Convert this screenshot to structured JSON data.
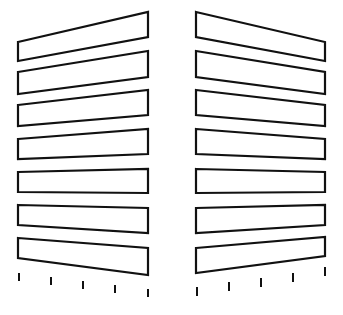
{
  "figure": {
    "stroke_color": "#111111",
    "fill_color": "#ffffff",
    "background": "#ffffff",
    "stroke_width": 2.2
  },
  "left_panel": {
    "x_left": 18,
    "x_right": 148,
    "bars": [
      {
        "lt": 42,
        "lb": 61,
        "rt": 12,
        "rb": 37
      },
      {
        "lt": 72,
        "lb": 94,
        "rt": 51,
        "rb": 77
      },
      {
        "lt": 105,
        "lb": 126,
        "rt": 90,
        "rb": 115
      },
      {
        "lt": 139,
        "lb": 159,
        "rt": 129,
        "rb": 154
      },
      {
        "lt": 172,
        "lb": 192,
        "rt": 169,
        "rb": 193
      },
      {
        "lt": 205,
        "lb": 225,
        "rt": 208,
        "rb": 233
      },
      {
        "lt": 238,
        "lb": 258,
        "rt": 248,
        "rb": 275
      }
    ],
    "ticks": [
      {
        "x": 19,
        "y1": 273,
        "y2": 281
      },
      {
        "x": 51,
        "y1": 277,
        "y2": 285
      },
      {
        "x": 83,
        "y1": 281,
        "y2": 289
      },
      {
        "x": 115,
        "y1": 285,
        "y2": 293
      },
      {
        "x": 148,
        "y1": 289,
        "y2": 297
      }
    ]
  },
  "right_panel": {
    "x_left": 196,
    "x_right": 325,
    "bars": [
      {
        "lt": 12,
        "lb": 37,
        "rt": 42,
        "rb": 61
      },
      {
        "lt": 51,
        "lb": 77,
        "rt": 72,
        "rb": 94
      },
      {
        "lt": 90,
        "lb": 115,
        "rt": 105,
        "rb": 126
      },
      {
        "lt": 129,
        "lb": 154,
        "rt": 139,
        "rb": 159
      },
      {
        "lt": 169,
        "lb": 193,
        "rt": 172,
        "rb": 192
      },
      {
        "lt": 208,
        "lb": 233,
        "rt": 205,
        "rb": 225
      },
      {
        "lt": 248,
        "lb": 273,
        "rt": 237,
        "rb": 256
      }
    ],
    "ticks": [
      {
        "x": 197,
        "y1": 287,
        "y2": 296
      },
      {
        "x": 229,
        "y1": 282,
        "y2": 291
      },
      {
        "x": 261,
        "y1": 278,
        "y2": 287
      },
      {
        "x": 293,
        "y1": 273,
        "y2": 282
      },
      {
        "x": 325,
        "y1": 267,
        "y2": 276
      }
    ]
  }
}
